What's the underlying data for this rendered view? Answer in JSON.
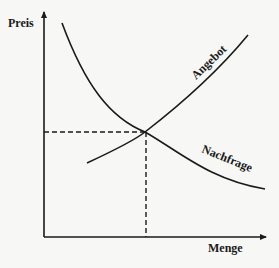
{
  "diagram": {
    "axes": {
      "y_label": "Preis",
      "x_label": "Menge"
    },
    "curves": [
      {
        "name": "Angebot",
        "label": "Angebot",
        "direction": "upward"
      },
      {
        "name": "Nachfrage",
        "label": "Nachfrage",
        "direction": "downward"
      }
    ],
    "equilibrium": {
      "description": "Gleichgewicht"
    },
    "colors": {
      "line": "#1a1a1a",
      "background": "#f7f7f5"
    }
  }
}
